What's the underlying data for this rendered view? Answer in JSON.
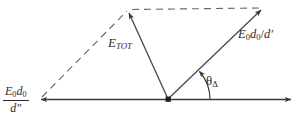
{
  "diagram": {
    "type": "vector-phasor-diagram",
    "background_color": "#ffffff",
    "stroke_color": "#3a3a3a",
    "labels": {
      "e_tot": {
        "base": "E",
        "subscript": "TOT",
        "full": "E_TOT"
      },
      "e0d0_over_dprime": {
        "base1": "E",
        "sub1": "0",
        "base2": "d",
        "sub2": "0",
        "slash": "/",
        "base3": "d",
        "prime": "′",
        "full": "E₀d₀ / d′"
      },
      "theta_delta": {
        "base": "θ",
        "subscript": "Δ",
        "full": "θΔ"
      },
      "e0d0_over_ddprime": {
        "numerator_base1": "E",
        "numerator_sub1": "0",
        "numerator_base2": "d",
        "numerator_sub2": "0",
        "denominator_base": "d",
        "denominator_prime": "″",
        "full": "E₀d₀ / d″"
      }
    },
    "vectors": [
      {
        "name": "resultant-vector",
        "label": "E_TOT",
        "style": "solid",
        "from": [
          168,
          99
        ],
        "to": [
          128,
          11
        ]
      },
      {
        "name": "right-vector",
        "label": "E₀d₀ / d′",
        "style": "solid",
        "from": [
          168,
          99
        ],
        "to": [
          262,
          9
        ]
      },
      {
        "name": "left-axis-vector",
        "label": "E₀d₀ / d″",
        "style": "solid",
        "from": [
          168,
          99
        ],
        "to": [
          40,
          99
        ]
      },
      {
        "name": "right-axis-vector",
        "label": "",
        "style": "solid",
        "from": [
          168,
          99
        ],
        "to": [
          292,
          99
        ]
      },
      {
        "name": "construction-left",
        "label": "",
        "style": "dashed",
        "from": [
          40,
          99
        ],
        "to": [
          128,
          11
        ]
      },
      {
        "name": "construction-top",
        "label": "",
        "style": "dashed",
        "from": [
          128,
          11
        ],
        "to": [
          262,
          9
        ]
      }
    ],
    "angle_arc": {
      "name": "theta-delta-arc",
      "center": [
        168,
        99
      ],
      "radius": 42,
      "from_deg": 0,
      "to_deg": 44,
      "arrow": "counterclockwise"
    },
    "origin_marker": {
      "name": "origin-point",
      "at": [
        168,
        99
      ],
      "shape": "square"
    }
  }
}
